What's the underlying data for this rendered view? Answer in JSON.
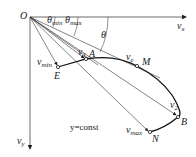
{
  "diagram": {
    "type": "velocity hodograph",
    "origin": "O",
    "axes": {
      "x": {
        "symbol": "v",
        "sub": "x"
      },
      "y": {
        "symbol": "v",
        "sub": "y"
      }
    },
    "angles": [
      {
        "symbol": "θ",
        "sub": "min"
      },
      {
        "symbol": "θ",
        "sub": "max"
      },
      {
        "symbol": "θ",
        "sub": ""
      }
    ],
    "points": [
      "E",
      "A",
      "M",
      "B",
      "N"
    ],
    "vectors": [
      {
        "symbol": "v",
        "sub": "min",
        "to": "E"
      },
      {
        "symbol": "v",
        "sub": "1",
        "to": "A"
      },
      {
        "symbol": "v",
        "sub": "e",
        "to": "M"
      },
      {
        "symbol": "v",
        "sub": "2",
        "to": "B"
      },
      {
        "symbol": "v",
        "sub": "max",
        "to": "N"
      }
    ],
    "curve_label": "y=const",
    "colors": {
      "line": "#222222",
      "axis": "#444444",
      "background": "#ffffff"
    }
  }
}
